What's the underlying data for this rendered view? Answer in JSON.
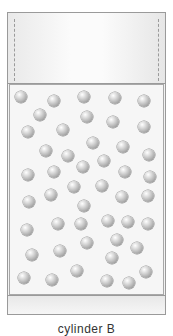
{
  "diagram": {
    "label": "cylinder B",
    "colors": {
      "border": "#9a9a9a",
      "chamber_bg": "#f6f6f6",
      "molecule_light": "#ffffff",
      "molecule_dark": "#7a7a7a"
    },
    "molecule_count": 46,
    "molecules": [
      [
        21,
        97
      ],
      [
        54,
        101
      ],
      [
        84,
        97
      ],
      [
        115,
        98
      ],
      [
        144,
        101
      ],
      [
        40,
        115
      ],
      [
        87,
        117
      ],
      [
        113,
        122
      ],
      [
        144,
        127
      ],
      [
        28,
        132
      ],
      [
        63,
        130
      ],
      [
        93,
        143
      ],
      [
        123,
        147
      ],
      [
        46,
        151
      ],
      [
        68,
        156
      ],
      [
        149,
        155
      ],
      [
        104,
        161
      ],
      [
        83,
        167
      ],
      [
        28,
        175
      ],
      [
        54,
        172
      ],
      [
        125,
        172
      ],
      [
        150,
        177
      ],
      [
        74,
        187
      ],
      [
        102,
        186
      ],
      [
        51,
        195
      ],
      [
        122,
        197
      ],
      [
        148,
        196
      ],
      [
        29,
        202
      ],
      [
        84,
        206
      ],
      [
        58,
        224
      ],
      [
        81,
        224
      ],
      [
        108,
        221
      ],
      [
        128,
        222
      ],
      [
        148,
        224
      ],
      [
        27,
        230
      ],
      [
        117,
        240
      ],
      [
        87,
        243
      ],
      [
        32,
        255
      ],
      [
        60,
        251
      ],
      [
        137,
        248
      ],
      [
        112,
        258
      ],
      [
        77,
        271
      ],
      [
        146,
        272
      ],
      [
        24,
        278
      ],
      [
        52,
        280
      ],
      [
        107,
        281
      ],
      [
        129,
        283
      ]
    ]
  }
}
